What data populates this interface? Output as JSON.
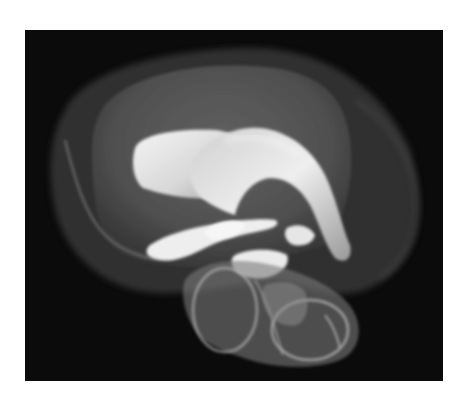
{
  "image": {
    "description": "3D volume rendering of brain ventricular system inside translucent brain and cerebellum surface on black background",
    "background_color": "#0b0b0b",
    "page_background": "#ffffff",
    "structures": [
      {
        "name": "brain-surface",
        "color": "#5a5a5a",
        "opacity": 0.55
      },
      {
        "name": "lateral-ventricle",
        "color": "#e8e8e8"
      },
      {
        "name": "third-ventricle",
        "color": "#f0f0f0"
      },
      {
        "name": "cerebellum-brainstem",
        "color": "#8a8a8a",
        "opacity": 0.6
      }
    ]
  }
}
